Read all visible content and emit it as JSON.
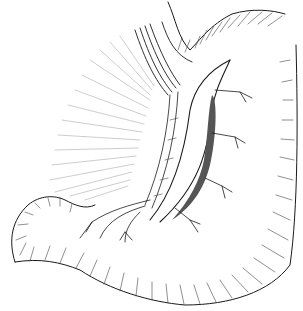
{
  "illustration": {
    "subject": "anatomical line drawing of stomach with incised wall and branching vessels",
    "width": 303,
    "height": 311,
    "colors": {
      "background": "#ffffff",
      "ink": "#1a1a1a",
      "hatch": "#444444",
      "shadow": "#555555"
    },
    "labels": []
  }
}
